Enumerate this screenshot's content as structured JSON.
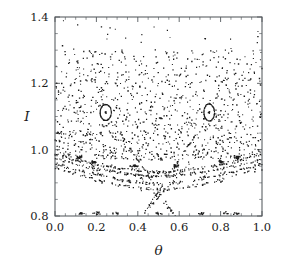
{
  "figure": {
    "kind": "poincare-section-scatter",
    "background_color": "#ffffff",
    "point_color": "#1b1b1b",
    "frame_color": "#555a5e",
    "width": 285,
    "height": 259
  },
  "axes": {
    "plot_box": {
      "left": 55,
      "top": 17,
      "right": 262,
      "bottom": 216
    },
    "x_title": "θ",
    "y_title": "I",
    "x_tick_labels": [
      "0.0",
      "0.2",
      "0.4",
      "0.6",
      "0.8",
      "1.0"
    ],
    "y_tick_labels": [
      "0.8",
      "1.0",
      "1.2",
      "1.4"
    ]
  },
  "chart_data": {
    "type": "scatter",
    "title": "",
    "xlabel": "θ",
    "ylabel": "I",
    "xlim": [
      0.0,
      1.0
    ],
    "ylim": [
      0.8,
      1.4
    ],
    "xticks": [
      0.0,
      0.2,
      0.4,
      0.6,
      0.8,
      1.0
    ],
    "yticks": [
      0.8,
      1.0,
      1.2,
      1.4
    ],
    "xminor_step": 0.05,
    "yminor_step": 0.05,
    "grid": false,
    "legend": null,
    "marker": {
      "shape": "dot",
      "size_px": 1.1,
      "color": "#1b1b1b"
    },
    "point_count_estimate": 2300,
    "series": [
      {
        "name": "chaotic-sea",
        "kind": "cloud",
        "n": 1150,
        "theta_range": [
          0.0,
          1.0
        ],
        "I_range": [
          0.965,
          1.3
        ],
        "note": "dense irregular scatter, density decreasing upward, thinning above I = 1.24"
      },
      {
        "name": "sparse-high-tail",
        "kind": "cloud",
        "n": 28,
        "theta_range": [
          0.02,
          0.99
        ],
        "I_range": [
          1.28,
          1.39
        ],
        "note": "isolated outliers near the top frame"
      },
      {
        "name": "kam-island-left",
        "kind": "ellipse-ring",
        "center": [
          0.245,
          1.112
        ],
        "semi_axis_theta": 0.028,
        "semi_axis_I": 0.025,
        "tilt_deg": -18,
        "n": 150,
        "has_center_fixed_point": true
      },
      {
        "name": "kam-island-right",
        "kind": "ellipse-ring",
        "center": [
          0.745,
          1.112
        ],
        "semi_axis_theta": 0.026,
        "semi_axis_I": 0.026,
        "tilt_deg": 12,
        "n": 150,
        "has_center_fixed_point": true
      },
      {
        "name": "invariant-curve-1",
        "kind": "arc",
        "edge_I": 0.985,
        "min_I": 0.932,
        "min_theta": 0.5,
        "n": 175
      },
      {
        "name": "invariant-curve-2",
        "kind": "arc",
        "edge_I": 0.972,
        "min_I": 0.918,
        "min_theta": 0.5,
        "n": 160
      },
      {
        "name": "invariant-curve-3",
        "kind": "arc",
        "edge_I": 0.958,
        "min_I": 0.897,
        "min_theta": 0.5,
        "n": 140
      },
      {
        "name": "invariant-curve-4",
        "kind": "arc",
        "edge_I": 0.944,
        "min_I": 0.879,
        "min_theta": 0.5,
        "n": 105
      },
      {
        "name": "separatrix-x-crossing",
        "kind": "x-cross",
        "center": [
          0.5,
          0.874
        ],
        "half_width": 0.185,
        "slope": 0.175,
        "n": 120
      },
      {
        "name": "lower-filaments",
        "kind": "x-cross",
        "center": [
          0.5,
          0.856
        ],
        "half_width": 0.26,
        "slope": 0.18,
        "n": 70
      },
      {
        "name": "bottom-island-chain",
        "kind": "blob-row",
        "I": 0.808,
        "theta_centers": [
          0.13,
          0.205,
          0.295,
          0.5,
          0.705,
          0.82,
          0.88
        ],
        "n": 65
      },
      {
        "name": "resonance-blobs-upper",
        "kind": "blobs",
        "positions": [
          [
            0.115,
            0.977
          ],
          [
            0.188,
            0.963
          ],
          [
            0.385,
            0.951
          ],
          [
            0.585,
            0.951
          ],
          [
            0.805,
            0.963
          ],
          [
            0.878,
            0.977
          ]
        ],
        "n": 90,
        "note": "dense elongated clumps embedded on the topmost invariant curves"
      }
    ]
  }
}
